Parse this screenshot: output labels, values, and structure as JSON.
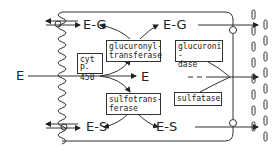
{
  "diagram": {
    "type": "metabolic-pathway",
    "nodes": {
      "e_left": "E",
      "e_center": "E",
      "eg_left": "E-G",
      "eg_right": "E-G",
      "es_left": "E-S",
      "es_right": "E-S"
    },
    "enzymes": {
      "cyp": [
        "cyt",
        "P-450"
      ],
      "ugt": [
        "glucuronyl-",
        "transferase"
      ],
      "gus": [
        "glucuroni -",
        "dase"
      ],
      "sult": [
        "sulfotrans-",
        "ferase"
      ],
      "sts": [
        "sulfatase"
      ]
    },
    "edges": [
      {
        "from": "E (outside)",
        "to": "E (cell)"
      },
      {
        "from": "E",
        "to": "E-G",
        "via": "glucuronyltransferase"
      },
      {
        "from": "E",
        "to": "E-S",
        "via": "sulfotransferase"
      },
      {
        "from": "E-G",
        "to": "E",
        "via": "glucuronidase"
      },
      {
        "from": "E-S",
        "to": "E",
        "via": "sulfatase"
      },
      {
        "from": "E-G",
        "to": "outside (left)",
        "via": "transporter"
      },
      {
        "from": "E-S",
        "to": "outside (left)",
        "via": "transporter"
      },
      {
        "from": "E-G",
        "to": "right compartment"
      },
      {
        "from": "E",
        "to": "right compartment"
      },
      {
        "from": "E-S",
        "to": "right compartment"
      }
    ]
  }
}
